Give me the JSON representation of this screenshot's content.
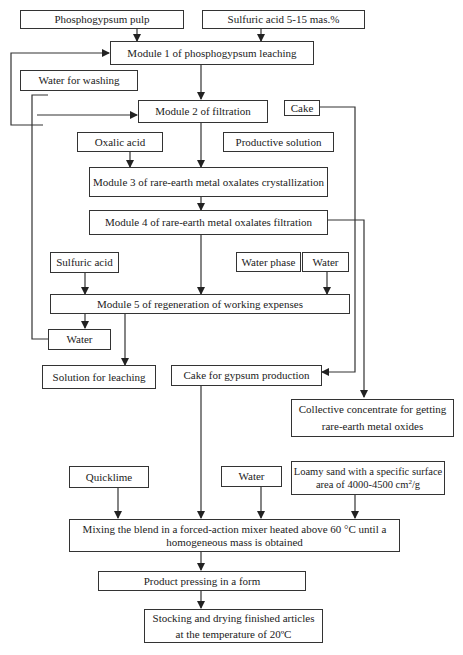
{
  "diagram": {
    "type": "process-flowchart",
    "colors": {
      "line": "#333333",
      "background": "#ffffff",
      "text": "#222222"
    },
    "boxes": {
      "phosphogypsum_pulp": "Phosphogypsum pulp",
      "sulfuric_acid_5_15": "Sulfuric acid 5-15 mas.%",
      "module1": "Module 1 of phosphogypsum leaching",
      "water_for_washing": "Water for washing",
      "module2": "Module 2 of filtration",
      "cake": "Cake",
      "oxalic_acid": "Oxalic acid",
      "productive_solution": "Productive solution",
      "module3": "Module 3 of rare-earth metal oxalates crystallization",
      "module4": "Module 4 of rare-earth metal oxalates filtration",
      "sulfuric_acid": "Sulfuric acid",
      "water_phase": "Water phase",
      "water_top": "Water",
      "module5": "Module 5 of regeneration of working expenses",
      "water_mid": "Water",
      "solution_for_leaching": "Solution for leaching",
      "cake_for_gypsum": "Cake for gypsum production",
      "collective_concentrate_line1": "Collective concentrate for getting",
      "collective_concentrate_line2": "rare-earth metal oxides",
      "quicklime": "Quicklime",
      "water_bottom": "Water",
      "loamy_sand_line1": "Loamy sand with a specific surface",
      "loamy_sand_line2_prefix": "area of 4000-4500 cm",
      "loamy_sand_exp": "2",
      "loamy_sand_line2_suffix": "/g",
      "mixing_line1": "Mixing the blend in a forced-action mixer heated above 60 °C until a",
      "mixing_line2": "homogeneous mass is obtained",
      "pressing": "Product pressing in a form",
      "stocking_line1": "Stocking and drying finished articles",
      "stocking_line2": "at the temperature of 20ºC"
    },
    "edges": [
      [
        "Phosphogypsum pulp",
        "Module 1"
      ],
      [
        "Sulfuric acid 5-15 mas.%",
        "Module 1"
      ],
      [
        "Module 1",
        "Module 2"
      ],
      [
        "Water (module 5 output)",
        "Module 2"
      ],
      [
        "Module 2",
        "Module 3"
      ],
      [
        "Oxalic acid",
        "Module 3"
      ],
      [
        "Cake",
        "Cake for gypsum production"
      ],
      [
        "Module 3",
        "Module 4"
      ],
      [
        "Module 4",
        "Module 5"
      ],
      [
        "Module 4",
        "Collective concentrate"
      ],
      [
        "Sulfuric acid",
        "Module 5"
      ],
      [
        "Water",
        "Module 5"
      ],
      [
        "Module 5",
        "Water"
      ],
      [
        "Module 5",
        "Solution for leaching"
      ],
      [
        "Solution for leaching",
        "Module 1"
      ],
      [
        "Cake for gypsum production",
        "Mixing"
      ],
      [
        "Quicklime",
        "Mixing"
      ],
      [
        "Water",
        "Mixing"
      ],
      [
        "Loamy sand",
        "Mixing"
      ],
      [
        "Mixing",
        "Product pressing"
      ],
      [
        "Product pressing",
        "Stocking and drying"
      ]
    ]
  }
}
